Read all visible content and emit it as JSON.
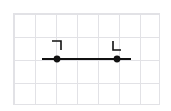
{
  "figure": {
    "title": "",
    "background_color": "#ffffff",
    "grid": {
      "visible": true,
      "color": "#e2e2e6",
      "cols": 7,
      "rows": 4,
      "cell_width": 21,
      "cell_height": 23,
      "left": 13,
      "top": 13,
      "width": 147,
      "height": 92
    },
    "stroke_color": "#111111"
  },
  "chart_data": {
    "type": "scatter",
    "title": "",
    "xlabel": "",
    "ylabel": "",
    "grid": true,
    "legend": "none",
    "xlim": [
      0,
      171
    ],
    "ylim": [
      0,
      111
    ],
    "series": [
      {
        "name": "segment",
        "kind": "line-with-endpoints",
        "x": [
          42,
          131
        ],
        "y": [
          59,
          59
        ],
        "line_width": 2.2,
        "color": "#111111"
      }
    ],
    "points": [
      {
        "label": "left-endpoint",
        "x": 57,
        "y": 59,
        "radius": 3.4,
        "color": "#111111"
      },
      {
        "label": "right-endpoint",
        "x": 117,
        "y": 59,
        "radius": 3.4,
        "color": "#111111"
      }
    ],
    "annotations": [
      {
        "label": "top-right-corner-bracket",
        "glyph": "not-sign",
        "x": 57,
        "y": 45,
        "description": "horizontal stroke with downward stroke at its right end"
      },
      {
        "label": "bottom-left-corner-bracket",
        "glyph": "L-shape",
        "x": 117,
        "y": 45,
        "description": "vertical stroke with rightward stroke at its bottom end"
      }
    ]
  }
}
